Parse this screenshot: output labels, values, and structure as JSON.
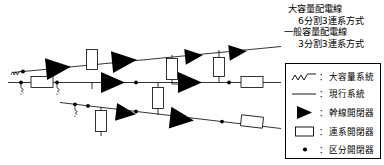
{
  "figure": {
    "kind": "power-distribution-line-diagram",
    "title_lines": [
      "大容量配電線",
      "6分割3連系方式",
      "一般容量配電線",
      "3分割3連系方式"
    ],
    "colors": {
      "line": "#000000",
      "fill": "#000000",
      "background": "#ffffff",
      "box_stroke": "#000000"
    }
  },
  "legend": {
    "items": [
      {
        "symbol": "wavy-line",
        "separator": "：",
        "label": "大容量系統"
      },
      {
        "symbol": "straight-line",
        "separator": "：",
        "label": "現行系統"
      },
      {
        "symbol": "filled-triangle",
        "separator": "：",
        "label": "幹線開閉器"
      },
      {
        "symbol": "open-rectangle",
        "separator": "：",
        "label": "連系開閉器"
      },
      {
        "symbol": "filled-dot",
        "separator": "：",
        "label": "区分開閉器"
      }
    ]
  },
  "feeders": [
    {
      "id": "upper-feeder",
      "name": "大容量配電線（上段）",
      "path": {
        "x1": 14,
        "y1": 72,
        "x2": 280,
        "y2": 47
      },
      "trunk_switches": 4,
      "section_switches": 1,
      "tie_switches": 2
    },
    {
      "id": "middle-feeder",
      "name": "一般容量配電線（中段）",
      "path": {
        "x1": 8,
        "y1": 82,
        "x2": 280,
        "y2": 82
      },
      "trunk_switches": 2,
      "section_switches": 4,
      "tie_switches": 2
    },
    {
      "id": "lower-feeder",
      "name": "一般容量配電線（下段）",
      "path": {
        "x1": 60,
        "y1": 103,
        "x2": 280,
        "y2": 128
      },
      "trunk_switches": 2,
      "section_switches": 4,
      "tie_switches": 2
    }
  ]
}
